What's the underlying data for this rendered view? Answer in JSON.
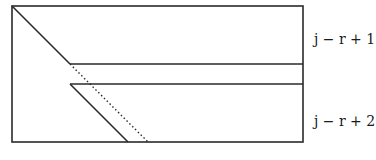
{
  "diagram": {
    "labels": {
      "upper": "j − r + 1",
      "lower": "j − r + 2"
    },
    "colors": {
      "stroke": "#2a2a2a",
      "background": "#ffffff"
    },
    "geometry": {
      "outer_rect": {
        "x1": 12,
        "y1": 6,
        "x2": 303,
        "y2": 142
      },
      "upper_strip_line_y": 64,
      "lower_strip_line_y": 84,
      "main_diagonal": {
        "x1": 12,
        "y1": 6,
        "x2": 70,
        "y2": 64
      },
      "dotted_diagonal": {
        "x1": 70,
        "y1": 64,
        "x2": 148,
        "y2": 142
      },
      "lower_diagonal": {
        "x1": 70,
        "y1": 84,
        "x2": 128,
        "y2": 142
      }
    }
  }
}
